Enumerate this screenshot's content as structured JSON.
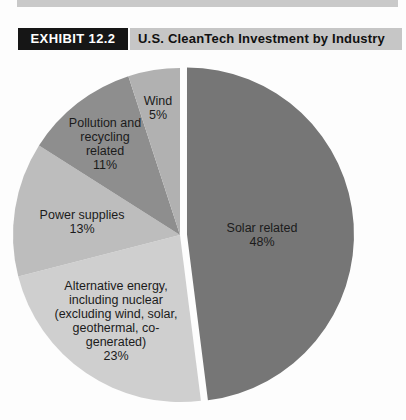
{
  "exhibit": {
    "tag": "EXHIBIT 12.2",
    "title": "U.S. CleanTech Investment by Industry",
    "tag_bg": "#161616",
    "tag_color": "#ffffff",
    "bar_bg": "#c6c6c6",
    "rule_bg": "#c9c9c9"
  },
  "chart_data": {
    "type": "pie",
    "title": "U.S. CleanTech Investment by Industry",
    "unit": "percent",
    "direction": "clockwise",
    "start_angle_deg": 0,
    "legend": "none",
    "labels_inside": true,
    "slices": [
      {
        "name": "solar",
        "label": "Solar related",
        "value": 48,
        "color": "#767676",
        "exploded": true,
        "display": "Solar related\n48%"
      },
      {
        "name": "alternative-energy",
        "label": "Alternative energy, including nuclear (excluding wind, solar, geothermal, co-generated)",
        "value": 23,
        "color": "#cfcfcf",
        "exploded": false,
        "display": "Alternative energy,\nincluding nuclear\n(excluding wind, solar,\ngeothermal, co-\ngenerated)\n23%"
      },
      {
        "name": "power-supplies",
        "label": "Power supplies",
        "value": 13,
        "color": "#bdbdbd",
        "exploded": false,
        "display": "Power supplies\n13%"
      },
      {
        "name": "pollution-recycling",
        "label": "Pollution and recycling related",
        "value": 11,
        "color": "#8e8e8e",
        "exploded": false,
        "display": "Pollution and\nrecycling\nrelated\n11%"
      },
      {
        "name": "wind",
        "label": "Wind",
        "value": 5,
        "color": "#b1b1b1",
        "exploded": false,
        "display": "Wind\n5%"
      }
    ]
  }
}
